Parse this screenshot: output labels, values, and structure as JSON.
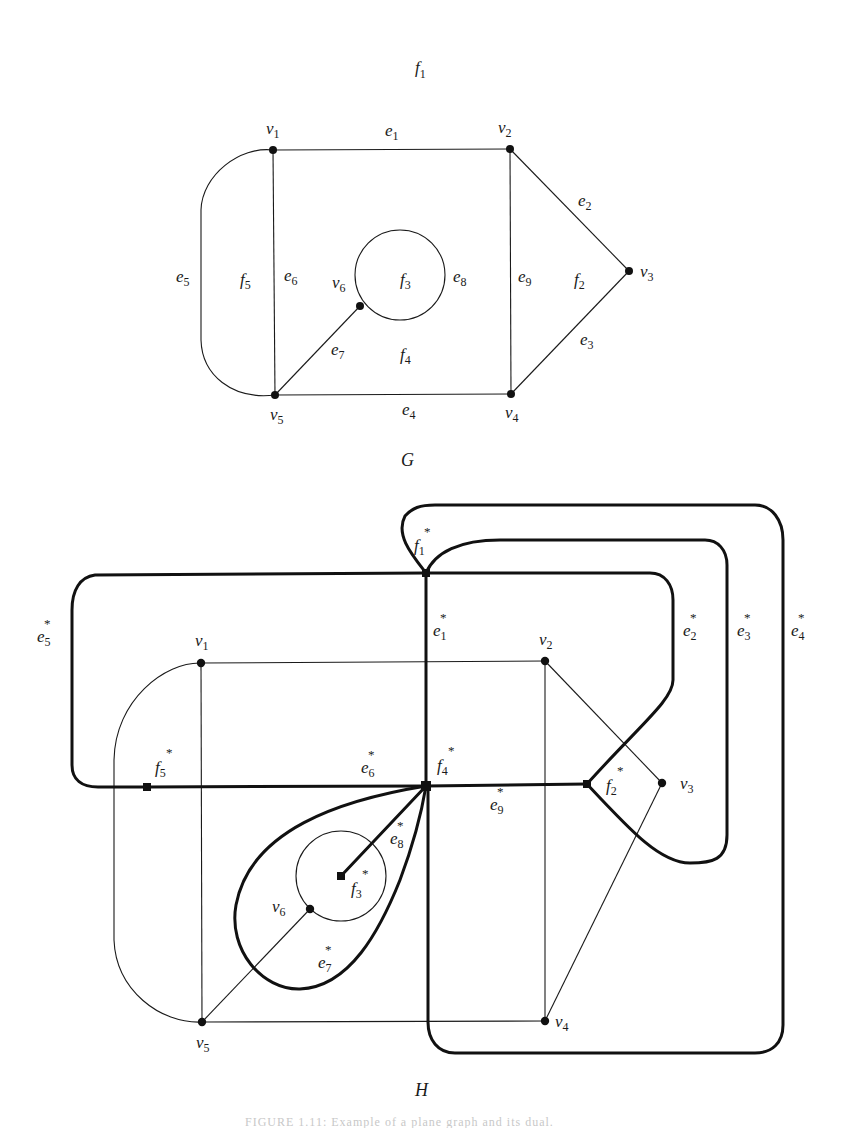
{
  "figure": {
    "caption": "FIGURE 1.11: Example of a plane graph and its dual."
  },
  "graph_G": {
    "title": "G",
    "outer_face_label": {
      "base": "f",
      "sub": "1"
    },
    "vertices": [
      {
        "id": "v1",
        "base": "v",
        "sub": "1",
        "x": 273,
        "y": 150
      },
      {
        "id": "v2",
        "base": "v",
        "sub": "2",
        "x": 510,
        "y": 149
      },
      {
        "id": "v3",
        "base": "v",
        "sub": "3",
        "x": 629,
        "y": 271
      },
      {
        "id": "v4",
        "base": "v",
        "sub": "4",
        "x": 511,
        "y": 394
      },
      {
        "id": "v5",
        "base": "v",
        "sub": "5",
        "x": 275,
        "y": 395
      },
      {
        "id": "v6",
        "base": "v",
        "sub": "6",
        "x": 360,
        "y": 306
      }
    ],
    "edges": [
      {
        "id": "e1",
        "base": "e",
        "sub": "1"
      },
      {
        "id": "e2",
        "base": "e",
        "sub": "2"
      },
      {
        "id": "e3",
        "base": "e",
        "sub": "3"
      },
      {
        "id": "e4",
        "base": "e",
        "sub": "4"
      },
      {
        "id": "e5",
        "base": "e",
        "sub": "5"
      },
      {
        "id": "e6",
        "base": "e",
        "sub": "6"
      },
      {
        "id": "e7",
        "base": "e",
        "sub": "7"
      },
      {
        "id": "e8",
        "base": "e",
        "sub": "8"
      },
      {
        "id": "e9",
        "base": "e",
        "sub": "9"
      }
    ],
    "faces": [
      {
        "id": "f1",
        "base": "f",
        "sub": "1"
      },
      {
        "id": "f2",
        "base": "f",
        "sub": "2"
      },
      {
        "id": "f3",
        "base": "f",
        "sub": "3"
      },
      {
        "id": "f4",
        "base": "f",
        "sub": "4"
      },
      {
        "id": "f5",
        "base": "f",
        "sub": "5"
      }
    ]
  },
  "graph_H": {
    "title": "H",
    "primal_vertices": [
      {
        "id": "v1",
        "base": "v",
        "sub": "1"
      },
      {
        "id": "v2",
        "base": "v",
        "sub": "2"
      },
      {
        "id": "v3",
        "base": "v",
        "sub": "3"
      },
      {
        "id": "v4",
        "base": "v",
        "sub": "4"
      },
      {
        "id": "v5",
        "base": "v",
        "sub": "5"
      },
      {
        "id": "v6",
        "base": "v",
        "sub": "6"
      }
    ],
    "dual_vertices": [
      {
        "id": "f1*",
        "base": "f",
        "sub": "1",
        "star": "*"
      },
      {
        "id": "f2*",
        "base": "f",
        "sub": "2",
        "star": "*"
      },
      {
        "id": "f3*",
        "base": "f",
        "sub": "3",
        "star": "*"
      },
      {
        "id": "f4*",
        "base": "f",
        "sub": "4",
        "star": "*"
      },
      {
        "id": "f5*",
        "base": "f",
        "sub": "5",
        "star": "*"
      }
    ],
    "dual_edges": [
      {
        "id": "e1*",
        "base": "e",
        "sub": "1",
        "star": "*"
      },
      {
        "id": "e2*",
        "base": "e",
        "sub": "2",
        "star": "*"
      },
      {
        "id": "e3*",
        "base": "e",
        "sub": "3",
        "star": "*"
      },
      {
        "id": "e4*",
        "base": "e",
        "sub": "4",
        "star": "*"
      },
      {
        "id": "e5*",
        "base": "e",
        "sub": "5",
        "star": "*"
      },
      {
        "id": "e6*",
        "base": "e",
        "sub": "6",
        "star": "*"
      },
      {
        "id": "e7*",
        "base": "e",
        "sub": "7",
        "star": "*"
      },
      {
        "id": "e8*",
        "base": "e",
        "sub": "8",
        "star": "*"
      },
      {
        "id": "e9*",
        "base": "e",
        "sub": "9",
        "star": "*"
      }
    ]
  },
  "colors": {
    "ink": "#111111",
    "background": "#ffffff"
  }
}
